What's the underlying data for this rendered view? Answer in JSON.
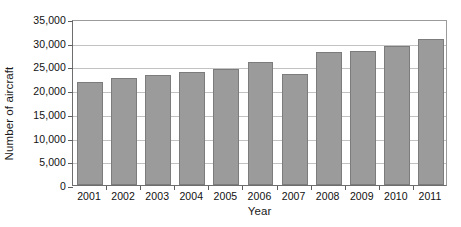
{
  "chart_data": {
    "type": "bar",
    "title": "",
    "xlabel": "Year",
    "ylabel": "Number of aircraft",
    "categories": [
      "2001",
      "2002",
      "2003",
      "2004",
      "2005",
      "2006",
      "2007",
      "2008",
      "2009",
      "2010",
      "2011"
    ],
    "values": [
      21700,
      22600,
      23200,
      23800,
      24500,
      26000,
      23500,
      28100,
      28200,
      29400,
      30700
    ],
    "ylim": [
      0,
      35000
    ],
    "ytick_values": [
      0,
      5000,
      10000,
      15000,
      20000,
      25000,
      30000,
      35000
    ],
    "ytick_labels": [
      "0",
      "5,000",
      "10,000",
      "15,000",
      "20,000",
      "25,000",
      "30,000",
      "35,000"
    ],
    "grid": true,
    "legend": false,
    "bar_color": "#9b9b9b",
    "bar_edge_color": "#7c7c7c",
    "grid_color": "#c2c2c2",
    "axis_color": "#6e6e6e"
  }
}
